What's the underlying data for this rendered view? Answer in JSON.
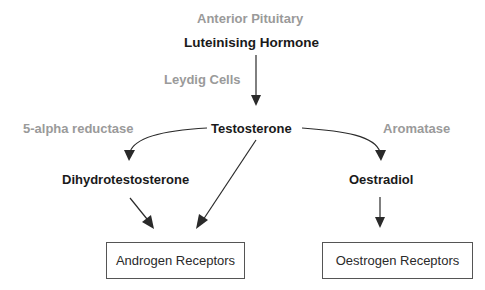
{
  "diagram": {
    "nodes": {
      "anterior_pituitary": {
        "label": "Anterior Pituitary",
        "style": "grey"
      },
      "luteinising_hormone": {
        "label": "Luteinising Hormone",
        "style": "dark"
      },
      "leydig_cells": {
        "label": "Leydig Cells",
        "style": "grey"
      },
      "testosterone": {
        "label": "Testosterone",
        "style": "dark"
      },
      "five_alpha_reductase": {
        "label": "5-alpha reductase",
        "style": "grey"
      },
      "aromatase": {
        "label": "Aromatase",
        "style": "grey"
      },
      "dihydrotestosterone": {
        "label": "Dihydrotestosterone",
        "style": "dark"
      },
      "oestradiol": {
        "label": "Oestradiol",
        "style": "dark"
      },
      "androgen_receptors": {
        "label": "Androgen Receptors",
        "style": "box"
      },
      "oestrogen_receptors": {
        "label": "Oestrogen Receptors",
        "style": "box"
      }
    },
    "edges": [
      {
        "from": "luteinising_hormone",
        "to": "testosterone",
        "label": "Leydig Cells"
      },
      {
        "from": "testosterone",
        "to": "dihydrotestosterone",
        "label": "5-alpha reductase"
      },
      {
        "from": "testosterone",
        "to": "oestradiol",
        "label": "Aromatase"
      },
      {
        "from": "dihydrotestosterone",
        "to": "androgen_receptors"
      },
      {
        "from": "testosterone",
        "to": "androgen_receptors"
      },
      {
        "from": "oestradiol",
        "to": "oestrogen_receptors"
      }
    ],
    "colors": {
      "label_dark": "#1a1a1a",
      "label_grey": "#9a9a9a",
      "arrow": "#2a2a2a",
      "box_border": "#555555"
    }
  }
}
